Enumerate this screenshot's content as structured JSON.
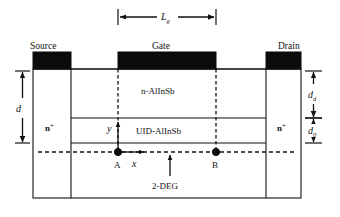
{
  "figure": {
    "kind": "device-cross-section-diagram"
  },
  "contacts": {
    "source_label": "Source",
    "gate_label": "Gate",
    "drain_label": "Drain"
  },
  "layers": {
    "barrier_label": "n-AlInSb",
    "spacer_label": "UID-AlInSb",
    "channel_label": "2-DEG",
    "ohmic_left_label": "n",
    "ohmic_left_sup": "+",
    "ohmic_right_label": "n",
    "ohmic_right_sup": "+"
  },
  "dimensions": {
    "gate_length_symbol": "L",
    "gate_length_sub": "g",
    "total_depth_symbol": "d",
    "doped_depth_symbol": "d",
    "doped_depth_sub": "d",
    "spacer_depth_symbol": "d",
    "spacer_depth_sub": "0"
  },
  "axes": {
    "x_label": "x",
    "y_label": "y",
    "origin_point_label": "A",
    "end_point_label": "B"
  },
  "colors": {
    "line": "#111111",
    "contact_fill": "#0b0b0b",
    "background": "#ffffff"
  }
}
